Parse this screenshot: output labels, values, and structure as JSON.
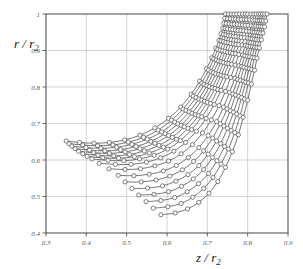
{
  "chart_data": {
    "type": "line",
    "title": "",
    "subtitle": "",
    "xlabel": "z / r2",
    "ylabel": "r / r2",
    "xlabel_parts": {
      "main": "z / r",
      "sub": "2"
    },
    "ylabel_parts": {
      "main": "r / r",
      "sub": "2"
    },
    "xlim": [
      0.3,
      0.9
    ],
    "ylim": [
      0.4,
      1.0
    ],
    "xticks": [
      0.3,
      0.4,
      0.5,
      0.6,
      0.7,
      0.8,
      0.9
    ],
    "xtick_labels": [
      "0.3",
      "0.4",
      "0.5",
      "0.6",
      "0.7",
      "0.8",
      "0.9"
    ],
    "yticks": [
      0.4,
      0.5,
      0.6,
      0.7,
      0.8,
      0.9,
      1.0
    ],
    "ytick_labels": [
      "0.4",
      "0.5",
      "0.6",
      "0.7",
      "0.8",
      "0.9",
      "1"
    ],
    "grid": true,
    "grid_color": "#c8c8c8",
    "legend": "none",
    "marker": "open-circle",
    "marker_size": 2.1,
    "line_color": "#4a4a4a",
    "marker_edge_color": "#4a4a4a",
    "marker_face_color": "#ffffff",
    "series": [
      {
        "name": "streamline-01",
        "x": [
          0.35,
          0.383,
          0.419,
          0.457,
          0.495,
          0.533,
          0.57,
          0.604,
          0.634,
          0.66,
          0.681,
          0.698,
          0.711,
          0.721,
          0.729,
          0.734,
          0.738,
          0.741,
          0.743,
          0.745
        ],
        "y": [
          0.652,
          0.648,
          0.646,
          0.648,
          0.655,
          0.668,
          0.688,
          0.714,
          0.745,
          0.78,
          0.816,
          0.85,
          0.88,
          0.906,
          0.928,
          0.946,
          0.961,
          0.975,
          0.988,
          1.0
        ]
      },
      {
        "name": "streamline-02",
        "x": [
          0.357,
          0.391,
          0.428,
          0.466,
          0.504,
          0.542,
          0.578,
          0.611,
          0.64,
          0.665,
          0.686,
          0.703,
          0.716,
          0.726,
          0.734,
          0.74,
          0.744,
          0.747,
          0.75,
          0.752
        ],
        "y": [
          0.645,
          0.641,
          0.639,
          0.641,
          0.649,
          0.662,
          0.682,
          0.709,
          0.74,
          0.775,
          0.811,
          0.846,
          0.877,
          0.903,
          0.926,
          0.944,
          0.96,
          0.974,
          0.987,
          1.0
        ]
      },
      {
        "name": "streamline-03",
        "x": [
          0.364,
          0.399,
          0.436,
          0.475,
          0.513,
          0.551,
          0.587,
          0.619,
          0.647,
          0.672,
          0.692,
          0.709,
          0.722,
          0.732,
          0.74,
          0.746,
          0.75,
          0.754,
          0.757,
          0.759
        ],
        "y": [
          0.638,
          0.634,
          0.632,
          0.635,
          0.643,
          0.657,
          0.677,
          0.704,
          0.736,
          0.771,
          0.807,
          0.842,
          0.874,
          0.901,
          0.924,
          0.943,
          0.959,
          0.973,
          0.987,
          1.0
        ]
      },
      {
        "name": "streamline-04",
        "x": [
          0.372,
          0.408,
          0.446,
          0.485,
          0.523,
          0.56,
          0.595,
          0.627,
          0.655,
          0.679,
          0.699,
          0.715,
          0.728,
          0.738,
          0.746,
          0.752,
          0.757,
          0.761,
          0.764,
          0.766
        ],
        "y": [
          0.631,
          0.627,
          0.625,
          0.628,
          0.637,
          0.651,
          0.672,
          0.699,
          0.732,
          0.767,
          0.804,
          0.839,
          0.871,
          0.899,
          0.922,
          0.941,
          0.958,
          0.972,
          0.986,
          1.0
        ]
      },
      {
        "name": "streamline-05",
        "x": [
          0.381,
          0.418,
          0.457,
          0.496,
          0.533,
          0.57,
          0.604,
          0.635,
          0.662,
          0.686,
          0.705,
          0.721,
          0.734,
          0.744,
          0.752,
          0.758,
          0.763,
          0.767,
          0.77,
          0.773
        ],
        "y": [
          0.624,
          0.62,
          0.618,
          0.622,
          0.631,
          0.646,
          0.667,
          0.695,
          0.728,
          0.764,
          0.801,
          0.836,
          0.869,
          0.897,
          0.921,
          0.94,
          0.957,
          0.972,
          0.986,
          1.0
        ]
      },
      {
        "name": "streamline-06",
        "x": [
          0.391,
          0.429,
          0.468,
          0.507,
          0.544,
          0.58,
          0.613,
          0.643,
          0.67,
          0.693,
          0.712,
          0.728,
          0.74,
          0.75,
          0.758,
          0.765,
          0.77,
          0.774,
          0.777,
          0.78
        ],
        "y": [
          0.617,
          0.613,
          0.611,
          0.615,
          0.625,
          0.64,
          0.662,
          0.691,
          0.724,
          0.761,
          0.798,
          0.834,
          0.867,
          0.895,
          0.919,
          0.939,
          0.956,
          0.971,
          0.985,
          1.0
        ]
      },
      {
        "name": "streamline-07",
        "x": [
          0.402,
          0.441,
          0.48,
          0.519,
          0.556,
          0.591,
          0.623,
          0.652,
          0.678,
          0.7,
          0.719,
          0.734,
          0.747,
          0.757,
          0.765,
          0.771,
          0.776,
          0.781,
          0.784,
          0.787
        ],
        "y": [
          0.61,
          0.606,
          0.605,
          0.609,
          0.619,
          0.635,
          0.657,
          0.687,
          0.721,
          0.758,
          0.796,
          0.832,
          0.865,
          0.894,
          0.918,
          0.938,
          0.955,
          0.97,
          0.985,
          1.0
        ]
      },
      {
        "name": "streamline-08",
        "x": [
          0.414,
          0.454,
          0.493,
          0.532,
          0.568,
          0.602,
          0.633,
          0.661,
          0.686,
          0.708,
          0.726,
          0.741,
          0.753,
          0.763,
          0.771,
          0.778,
          0.783,
          0.787,
          0.791,
          0.794
        ],
        "y": [
          0.603,
          0.599,
          0.598,
          0.603,
          0.613,
          0.63,
          0.653,
          0.683,
          0.718,
          0.755,
          0.793,
          0.83,
          0.864,
          0.892,
          0.917,
          0.937,
          0.955,
          0.97,
          0.985,
          1.0
        ]
      },
      {
        "name": "streamline-09",
        "x": [
          0.432,
          0.472,
          0.511,
          0.549,
          0.584,
          0.617,
          0.646,
          0.673,
          0.697,
          0.717,
          0.734,
          0.748,
          0.76,
          0.77,
          0.778,
          0.784,
          0.79,
          0.794,
          0.797,
          0.8
        ],
        "y": [
          0.591,
          0.588,
          0.588,
          0.594,
          0.606,
          0.624,
          0.648,
          0.679,
          0.714,
          0.752,
          0.791,
          0.828,
          0.862,
          0.891,
          0.916,
          0.936,
          0.954,
          0.969,
          0.984,
          1.0
        ]
      },
      {
        "name": "streamline-10",
        "x": [
          0.456,
          0.496,
          0.534,
          0.57,
          0.604,
          0.635,
          0.663,
          0.688,
          0.71,
          0.729,
          0.745,
          0.758,
          0.769,
          0.778,
          0.786,
          0.792,
          0.797,
          0.801,
          0.805,
          0.808
        ],
        "y": [
          0.576,
          0.574,
          0.576,
          0.584,
          0.597,
          0.617,
          0.642,
          0.674,
          0.71,
          0.749,
          0.788,
          0.826,
          0.86,
          0.889,
          0.915,
          0.935,
          0.953,
          0.969,
          0.984,
          1.0
        ]
      },
      {
        "name": "streamline-11",
        "x": [
          0.479,
          0.518,
          0.556,
          0.591,
          0.623,
          0.653,
          0.679,
          0.702,
          0.723,
          0.74,
          0.755,
          0.768,
          0.778,
          0.787,
          0.794,
          0.8,
          0.805,
          0.809,
          0.812,
          0.815
        ],
        "y": [
          0.558,
          0.557,
          0.561,
          0.57,
          0.585,
          0.607,
          0.634,
          0.667,
          0.705,
          0.745,
          0.785,
          0.824,
          0.858,
          0.888,
          0.914,
          0.934,
          0.952,
          0.968,
          0.983,
          1.0
        ]
      },
      {
        "name": "streamline-12",
        "x": [
          0.496,
          0.536,
          0.573,
          0.607,
          0.638,
          0.666,
          0.691,
          0.713,
          0.732,
          0.749,
          0.763,
          0.775,
          0.785,
          0.793,
          0.8,
          0.806,
          0.811,
          0.815,
          0.818,
          0.821
        ],
        "y": [
          0.54,
          0.54,
          0.545,
          0.556,
          0.573,
          0.596,
          0.625,
          0.66,
          0.699,
          0.74,
          0.781,
          0.821,
          0.856,
          0.886,
          0.912,
          0.933,
          0.951,
          0.967,
          0.983,
          1.0
        ]
      },
      {
        "name": "streamline-13",
        "x": [
          0.513,
          0.552,
          0.589,
          0.622,
          0.652,
          0.679,
          0.702,
          0.723,
          0.741,
          0.757,
          0.77,
          0.782,
          0.791,
          0.799,
          0.806,
          0.811,
          0.816,
          0.82,
          0.824,
          0.827
        ],
        "y": [
          0.522,
          0.523,
          0.529,
          0.542,
          0.56,
          0.585,
          0.616,
          0.652,
          0.693,
          0.735,
          0.778,
          0.818,
          0.854,
          0.884,
          0.911,
          0.932,
          0.95,
          0.967,
          0.982,
          1.0
        ]
      },
      {
        "name": "streamline-14",
        "x": [
          0.53,
          0.568,
          0.604,
          0.636,
          0.665,
          0.691,
          0.713,
          0.733,
          0.75,
          0.765,
          0.778,
          0.789,
          0.798,
          0.805,
          0.812,
          0.817,
          0.822,
          0.826,
          0.829,
          0.832
        ],
        "y": [
          0.504,
          0.506,
          0.513,
          0.528,
          0.548,
          0.574,
          0.607,
          0.645,
          0.687,
          0.731,
          0.774,
          0.816,
          0.852,
          0.883,
          0.91,
          0.931,
          0.95,
          0.966,
          0.982,
          1.0
        ]
      },
      {
        "name": "streamline-15",
        "x": [
          0.548,
          0.585,
          0.619,
          0.65,
          0.678,
          0.703,
          0.724,
          0.743,
          0.759,
          0.773,
          0.785,
          0.795,
          0.804,
          0.811,
          0.817,
          0.822,
          0.827,
          0.831,
          0.834,
          0.837
        ],
        "y": [
          0.486,
          0.489,
          0.497,
          0.513,
          0.535,
          0.563,
          0.598,
          0.637,
          0.681,
          0.726,
          0.771,
          0.813,
          0.85,
          0.881,
          0.909,
          0.93,
          0.949,
          0.966,
          0.982,
          1.0
        ]
      },
      {
        "name": "streamline-16",
        "x": [
          0.566,
          0.602,
          0.635,
          0.664,
          0.691,
          0.714,
          0.734,
          0.752,
          0.768,
          0.781,
          0.792,
          0.802,
          0.81,
          0.817,
          0.823,
          0.828,
          0.832,
          0.836,
          0.839,
          0.842
        ],
        "y": [
          0.468,
          0.472,
          0.481,
          0.498,
          0.522,
          0.552,
          0.589,
          0.63,
          0.675,
          0.721,
          0.767,
          0.811,
          0.848,
          0.88,
          0.908,
          0.929,
          0.948,
          0.965,
          0.981,
          1.0
        ]
      },
      {
        "name": "streamline-17",
        "x": [
          0.585,
          0.62,
          0.651,
          0.679,
          0.704,
          0.726,
          0.745,
          0.762,
          0.777,
          0.789,
          0.8,
          0.809,
          0.817,
          0.823,
          0.829,
          0.834,
          0.838,
          0.842,
          0.845,
          0.848
        ],
        "y": [
          0.45,
          0.455,
          0.466,
          0.484,
          0.509,
          0.541,
          0.58,
          0.623,
          0.669,
          0.717,
          0.764,
          0.808,
          0.846,
          0.879,
          0.907,
          0.929,
          0.948,
          0.965,
          0.981,
          1.0
        ]
      }
    ]
  },
  "axes": {
    "frame_color": "#555555",
    "tick_color": "#555555"
  }
}
